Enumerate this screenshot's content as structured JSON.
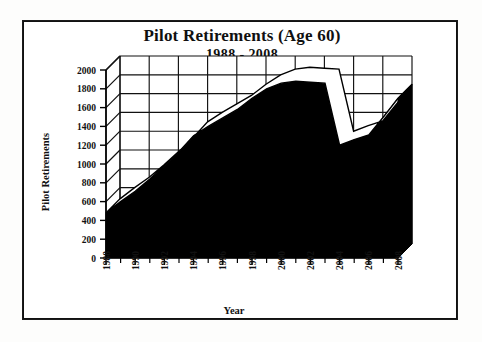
{
  "chart_data": {
    "type": "area",
    "title": "Pilot Retirements (Age 60)",
    "subtitle": "1988 - 2008",
    "xlabel": "Year",
    "ylabel": "Pilot Retirements",
    "xlim": [
      1988,
      2008
    ],
    "ylim": [
      0,
      2000
    ],
    "y_ticks": [
      0,
      200,
      400,
      600,
      800,
      1000,
      1200,
      1400,
      1600,
      1800,
      2000
    ],
    "x_ticks": [
      1988,
      1990,
      1992,
      1994,
      1996,
      1998,
      2000,
      2002,
      2004,
      2006,
      2008
    ],
    "x_minor_ticks": [
      1989,
      1991,
      1993,
      1995,
      1997,
      1999,
      2001,
      2003,
      2005,
      2007
    ],
    "grid": true,
    "legend": "none",
    "style": "3d-area-black-fill",
    "x": [
      1988,
      1989,
      1990,
      1991,
      1992,
      1993,
      1994,
      1995,
      1996,
      1997,
      1998,
      1999,
      2000,
      2001,
      2002,
      2003,
      2004,
      2005,
      2006,
      2007,
      2008
    ],
    "values": [
      480,
      600,
      710,
      840,
      980,
      1130,
      1300,
      1400,
      1490,
      1580,
      1700,
      1800,
      1860,
      1880,
      1870,
      1860,
      1200,
      1260,
      1310,
      1500,
      1700
    ],
    "series": [
      {
        "name": "Pilot Retirements",
        "values": [
          480,
          600,
          710,
          840,
          980,
          1130,
          1300,
          1400,
          1490,
          1580,
          1700,
          1800,
          1860,
          1880,
          1870,
          1860,
          1200,
          1260,
          1310,
          1500,
          1700
        ]
      }
    ],
    "annotations": {
      "peak_year": 2001,
      "peak_value": 1880,
      "trough_year": 2004,
      "trough_value": 1200,
      "start_value": 480,
      "end_value": 1700
    }
  },
  "axes": {
    "y_labels": [
      "2000",
      "1800",
      "1600",
      "1400",
      "1200",
      "1000",
      "800",
      "600",
      "400",
      "200",
      "0"
    ],
    "x_labels": [
      "1988",
      "1990",
      "1992",
      "1994",
      "1996",
      "1998",
      "2000",
      "2002",
      "2004",
      "2006",
      "2008"
    ],
    "y_title": "Pilot Retirements",
    "x_title": "Year"
  },
  "colors": {
    "series_fill": "#000000",
    "series_top": "#ffffff",
    "grid": "#111111",
    "frame": "#1b1b1b",
    "background": "#ffffff",
    "text": "#111111"
  }
}
